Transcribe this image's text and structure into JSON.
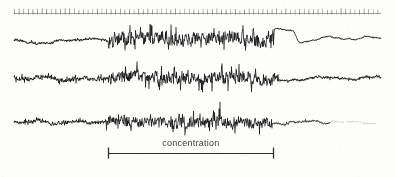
{
  "figure": {
    "width": 395,
    "height": 177,
    "background_color": "#fdfdfc",
    "ink_color": "#1a1a1a",
    "faded_ink_color": "#8d8d8d",
    "annotation_color": "#3a3a3a"
  },
  "annotations": {
    "interval_label": "concentration"
  },
  "chart_data": {
    "type": "line",
    "title": "",
    "subtitle": "",
    "xlabel": "",
    "ylabel": "",
    "grid": false,
    "legend_position": "none",
    "x": {
      "axis_type": "time",
      "range_px": [
        14,
        381
      ],
      "tick_row": {
        "name": "time-ticks",
        "baseline_y": 13,
        "start_x": 14,
        "end_x": 381,
        "tick_spacing_px": 4.6,
        "tick_count": 80,
        "tick_height_px": 4,
        "line_color": "#7e7e7e",
        "tick_color": "#6a6a6a"
      }
    },
    "interval_markers": [
      {
        "name": "concentration",
        "label": "concentration",
        "start_x": 108,
        "end_x": 274,
        "y": 153,
        "cap_height_px": 11,
        "color": "#2e2e2e"
      }
    ],
    "series": [
      {
        "name": "trace-1",
        "baseline_y": 40,
        "x_start": 14,
        "x_end": 381,
        "color": "#1b1b1b",
        "line_width": 0.8,
        "segments": [
          {
            "from_x": 14,
            "to_x": 108,
            "amplitude": 3.2,
            "roughness": 0.3,
            "fade": 1.0
          },
          {
            "from_x": 108,
            "to_x": 274,
            "amplitude": 11.5,
            "roughness": 0.95,
            "fade": 1.0
          },
          {
            "from_x": 274,
            "to_x": 381,
            "amplitude": 2.0,
            "roughness": 0.1,
            "fade": 0.85
          }
        ],
        "baseline_drift": [
          {
            "x": 14,
            "y": 40
          },
          {
            "x": 40,
            "y": 44
          },
          {
            "x": 70,
            "y": 41
          },
          {
            "x": 110,
            "y": 40
          },
          {
            "x": 150,
            "y": 37
          },
          {
            "x": 190,
            "y": 39
          },
          {
            "x": 230,
            "y": 38
          },
          {
            "x": 268,
            "y": 43
          },
          {
            "x": 276,
            "y": 29
          },
          {
            "x": 292,
            "y": 30
          },
          {
            "x": 300,
            "y": 44
          },
          {
            "x": 330,
            "y": 38
          },
          {
            "x": 350,
            "y": 40
          },
          {
            "x": 365,
            "y": 36
          },
          {
            "x": 381,
            "y": 40
          }
        ],
        "notes": "Quiet left flank, dense high-amplitude burst through the concentration interval, abrupt step discontinuity near x=274 then a smooth low-noise tail."
      },
      {
        "name": "trace-2",
        "baseline_y": 78,
        "x_start": 14,
        "x_end": 381,
        "color": "#141414",
        "line_width": 0.8,
        "segments": [
          {
            "from_x": 14,
            "to_x": 108,
            "amplitude": 4.0,
            "roughness": 0.8,
            "fade": 1.0
          },
          {
            "from_x": 108,
            "to_x": 278,
            "amplitude": 10.5,
            "roughness": 1.0,
            "fade": 1.0
          },
          {
            "from_x": 278,
            "to_x": 381,
            "amplitude": 2.4,
            "roughness": 0.55,
            "fade": 0.95
          }
        ],
        "baseline_drift": [
          {
            "x": 14,
            "y": 78
          },
          {
            "x": 60,
            "y": 79
          },
          {
            "x": 120,
            "y": 77
          },
          {
            "x": 180,
            "y": 78
          },
          {
            "x": 240,
            "y": 77
          },
          {
            "x": 280,
            "y": 79
          },
          {
            "x": 330,
            "y": 78
          },
          {
            "x": 381,
            "y": 78
          }
        ],
        "notes": "Continuously noisy baseline; amplitude swells markedly across the concentration interval and settles into fine low-amplitude hash afterwards."
      },
      {
        "name": "trace-3",
        "baseline_y": 122,
        "x_start": 14,
        "x_end": 378,
        "color": "#161616",
        "line_width": 0.8,
        "segments": [
          {
            "from_x": 14,
            "to_x": 106,
            "amplitude": 3.0,
            "roughness": 0.75,
            "fade": 1.0
          },
          {
            "from_x": 106,
            "to_x": 272,
            "amplitude": 9.5,
            "roughness": 1.0,
            "fade": 1.0
          },
          {
            "from_x": 272,
            "to_x": 330,
            "amplitude": 2.0,
            "roughness": 0.5,
            "fade": 0.7
          },
          {
            "from_x": 330,
            "to_x": 378,
            "amplitude": 1.2,
            "roughness": 0.35,
            "fade": 0.3
          }
        ],
        "baseline_drift": [
          {
            "x": 14,
            "y": 122
          },
          {
            "x": 60,
            "y": 123
          },
          {
            "x": 120,
            "y": 121
          },
          {
            "x": 180,
            "y": 122
          },
          {
            "x": 240,
            "y": 121
          },
          {
            "x": 290,
            "y": 123
          },
          {
            "x": 340,
            "y": 122
          },
          {
            "x": 378,
            "y": 122
          }
        ],
        "notes": "Lowest channel; burst activity confined to the concentration interval, then the trace fades to a faint broken dotted line toward the right margin."
      }
    ]
  }
}
